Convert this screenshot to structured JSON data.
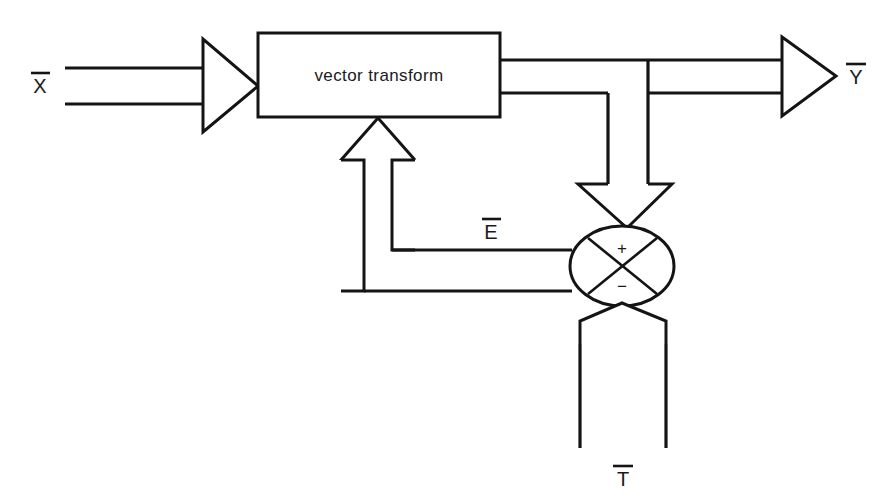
{
  "diagram": {
    "background_color": "#ffffff",
    "line_color": "#141414",
    "blocks": [
      {
        "id": "vector-transform",
        "label": "vector transform",
        "shape": "rectangle"
      }
    ],
    "junction": {
      "id": "summing-junction",
      "shape": "ellipse-with-cross",
      "plus_sign": "+",
      "minus_sign": "−"
    },
    "signals": {
      "input": "X̅",
      "output": "Y̅",
      "error": "E̅",
      "target": "T̅"
    },
    "signal_plain": {
      "input": "X",
      "output": "Y",
      "error": "E",
      "target": "T"
    },
    "connections": [
      {
        "from": "X̅",
        "to": "vector transform",
        "style": "wide-hollow-arrow",
        "direction": "right"
      },
      {
        "from": "vector transform",
        "to": "Y̅",
        "style": "wide-hollow-arrow",
        "direction": "right"
      },
      {
        "from": "vector transform",
        "to": "summing-junction",
        "style": "wide-hollow-arrow",
        "direction": "down"
      },
      {
        "from": "T̅",
        "to": "summing-junction",
        "style": "wide-hollow-arrow",
        "direction": "up"
      },
      {
        "from": "summing-junction",
        "to": "vector transform",
        "style": "wide-hollow-arrow",
        "direction": "up",
        "label": "E̅"
      }
    ]
  }
}
